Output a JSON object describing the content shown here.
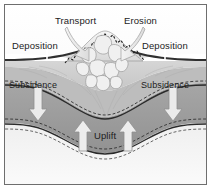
{
  "diagram": {
    "frame_border_color": "#6e6e6e",
    "background_color": "#f2f2f2"
  },
  "labels": {
    "transport": "Transport",
    "erosion": "Erosion",
    "deposition_left": "Deposition",
    "deposition_right": "Deposition",
    "subsidence_left": "Subsidence",
    "subsidence_right": "Subsidence",
    "uplift": "Uplift"
  },
  "arrows": {
    "transport_arrow": "curved-arrow-down-left",
    "erosion_arrow": "curved-arrow-down-right",
    "subsidence_left_arrow": "arrow-down",
    "subsidence_right_arrow": "arrow-down",
    "uplift_arrow_left": "arrow-up",
    "uplift_arrow_right": "arrow-up",
    "leader_left": "leader-line",
    "leader_right": "leader-line"
  },
  "layers": [
    {
      "name": "sky",
      "color": "#fbfbfb"
    },
    {
      "name": "upper-sediment",
      "color": "#d2d2d2"
    },
    {
      "name": "mid-crust",
      "color": "#9c9c9c"
    },
    {
      "name": "lower-crust",
      "color": "#e8e8e8"
    },
    {
      "name": "mountain-core",
      "color": "#eeeeee"
    }
  ],
  "colors": {
    "arrow_fill": "#e9e9e9",
    "arrow_stroke": "#8a8a8a",
    "dark_line": "#3a3a3a",
    "text": "#1c1c1c"
  }
}
